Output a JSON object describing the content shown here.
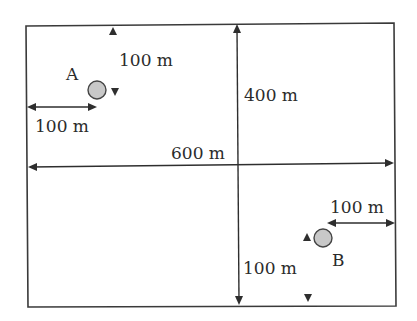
{
  "diagram": {
    "field": {
      "width_label": "600 m",
      "height_label": "400 m"
    },
    "point_a": {
      "label": "A",
      "offset_left_label": "100 m",
      "offset_top_label": "100 m",
      "fill_color": "#c8c8c8"
    },
    "point_b": {
      "label": "B",
      "offset_right_label": "100 m",
      "offset_bottom_label": "100 m",
      "fill_color": "#c8c8c8"
    },
    "colors": {
      "line": "#3a3a3a",
      "text": "#2b2b2b",
      "background": "#ffffff"
    }
  }
}
